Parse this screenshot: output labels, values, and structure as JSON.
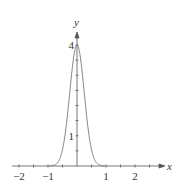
{
  "chart_data": {
    "type": "line",
    "title": "",
    "function": "y = 4·exp(-8x²)",
    "xlabel": "x",
    "ylabel": "y",
    "xlim": [
      -2.2,
      2.9
    ],
    "ylim": [
      0,
      4.4
    ],
    "x_ticks": [
      -2,
      -1,
      1,
      2
    ],
    "x_tick_labels": [
      "−2",
      "−1",
      "1",
      "2"
    ],
    "y_tick_labels": [
      "1",
      "4"
    ],
    "y_ticks": [
      1,
      4
    ],
    "grid": false,
    "series": [
      {
        "name": "curve",
        "x": [
          -1.0,
          -0.8,
          -0.6,
          -0.4,
          -0.2,
          0,
          0.2,
          0.4,
          0.6,
          0.8,
          1.0
        ],
        "y": [
          0.0,
          0.02,
          0.22,
          1.11,
          2.9,
          4.0,
          2.9,
          1.11,
          0.22,
          0.02,
          0.0
        ]
      }
    ]
  }
}
